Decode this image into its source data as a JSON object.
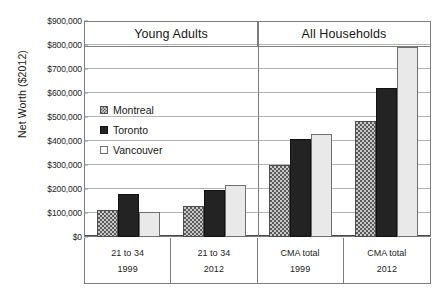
{
  "chart_data": {
    "type": "bar",
    "title": "",
    "xlabel": "",
    "ylabel": "Net Worth ($2012)",
    "ylim": [
      0,
      900000
    ],
    "ytick_step": 100000,
    "grid": true,
    "legend_position": "inside-upper-left",
    "yticks": [
      "$900,000",
      "$800,000",
      "$700,000",
      "$600,000",
      "$500,000",
      "$400,000",
      "$300,000",
      "$200,000",
      "$100,000",
      "$0"
    ],
    "ytick_values": [
      900000,
      800000,
      700000,
      600000,
      500000,
      400000,
      300000,
      200000,
      100000,
      0
    ],
    "panels": [
      {
        "label": "Young Adults"
      },
      {
        "label": "All Households"
      }
    ],
    "categories": [
      "21 to 34",
      "21 to 34",
      "CMA total",
      "CMA total"
    ],
    "category_years": [
      "1999",
      "2012",
      "1999",
      "2012"
    ],
    "series": [
      {
        "name": "Montreal",
        "values": [
          112000,
          128000,
          302000,
          487000
        ]
      },
      {
        "name": "Toronto",
        "values": [
          182000,
          196000,
          410000,
          622000
        ]
      },
      {
        "name": "Vancouver",
        "values": [
          105000,
          219000,
          433000,
          795000
        ]
      }
    ],
    "legend": [
      "Montreal",
      "Toronto",
      "Vancouver"
    ],
    "colors": {
      "montreal": "#c9c9c9",
      "toronto": "#232323",
      "vancouver": "#e9e9e9",
      "gridline": "#b4b4b4",
      "frame": "#7d7d7d",
      "text": "#161616"
    }
  }
}
